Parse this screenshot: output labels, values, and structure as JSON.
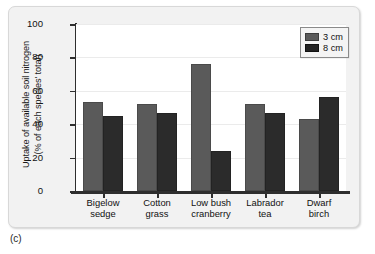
{
  "caption": "(c)",
  "legend": {
    "position": "top-right",
    "entries": [
      {
        "label": "3 cm",
        "color": "#5a5a5a"
      },
      {
        "label": "8 cm",
        "color": "#2b2b2b"
      }
    ]
  },
  "chart_data": {
    "type": "bar",
    "title": "",
    "subtitle": "",
    "xlabel": "",
    "ylabel": "Uptake of available soil nitrogen\n(% of each species' total)",
    "ylim": [
      0,
      100
    ],
    "yticks": [
      0,
      20,
      40,
      60,
      80,
      100
    ],
    "ytick_labels": [
      "0",
      "20",
      "40",
      "60",
      "80",
      "100"
    ],
    "grid": true,
    "categories": [
      "Bigelow\nsedge",
      "Cotton\ngrass",
      "Low bush\ncranberry",
      "Labrador\ntea",
      "Dwarf\nbirch"
    ],
    "series": [
      {
        "name": "3 cm",
        "color": "#5a5a5a",
        "values": [
          53,
          52,
          76,
          52,
          43
        ]
      },
      {
        "name": "8 cm",
        "color": "#2b2b2b",
        "values": [
          45,
          47,
          24,
          47,
          56
        ]
      }
    ],
    "legend_position": "top-right"
  }
}
